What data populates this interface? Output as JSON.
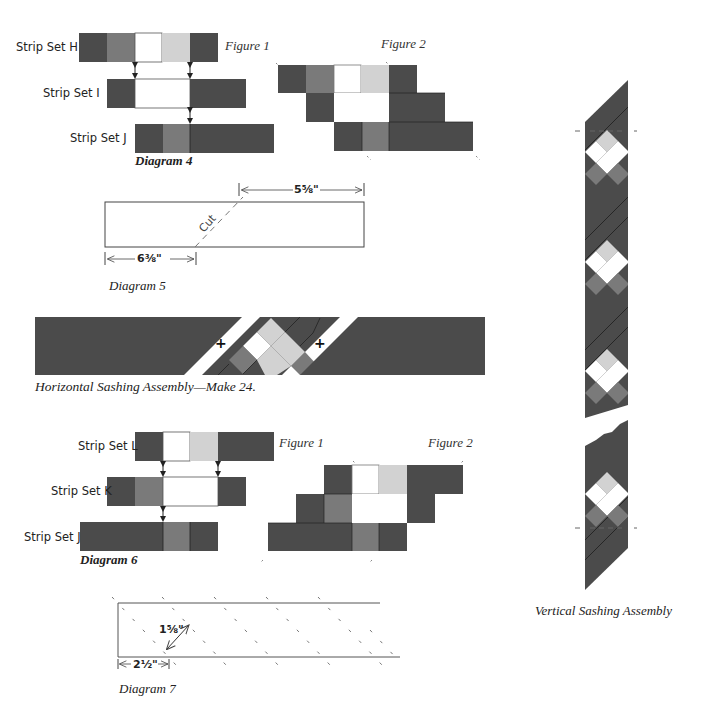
{
  "colors": {
    "dark": "#4b4b4b",
    "medium": "#7a7a7a",
    "light": "#d2d2d2",
    "white": "#ffffff",
    "line": "#222222"
  },
  "diagram4": {
    "caption": "Diagram 4",
    "figure1": "Figure 1",
    "figure2": "Figure 2",
    "strip_sets": [
      {
        "label": "Strip Set H",
        "cells": [
          "dark",
          "medium",
          "white",
          "light",
          "dark"
        ]
      },
      {
        "label": "Strip Set I",
        "cells": [
          "dark",
          "white",
          "white",
          "dark",
          "dark"
        ]
      },
      {
        "label": "Strip Set J",
        "cells": [
          "dark",
          "medium",
          "dark",
          "dark",
          "dark"
        ]
      }
    ]
  },
  "diagram5": {
    "caption": "Diagram 5",
    "cut_label": "Cut",
    "top_dimension": "5⅝\"",
    "bottom_dimension": "6⅜\""
  },
  "horizontal_sashing": {
    "caption": "Horizontal Sashing Assembly—Make 24.",
    "plus": "+"
  },
  "diagram6": {
    "caption": "Diagram 6",
    "figure1": "Figure 1",
    "figure2": "Figure 2",
    "strip_sets": [
      {
        "label": "Strip Set L",
        "cells": [
          "dark",
          "white",
          "light",
          "dark",
          "dark"
        ]
      },
      {
        "label": "Strip Set K",
        "cells": [
          "dark",
          "medium",
          "white",
          "white",
          "dark"
        ]
      },
      {
        "label": "Strip Set J",
        "cells": [
          "dark",
          "dark",
          "dark",
          "medium",
          "dark"
        ]
      }
    ]
  },
  "diagram7": {
    "caption": "Diagram 7",
    "diagonal_dimension": "1⅝\"",
    "base_dimension": "2½\""
  },
  "vertical_sashing": {
    "caption": "Vertical Sashing Assembly"
  }
}
